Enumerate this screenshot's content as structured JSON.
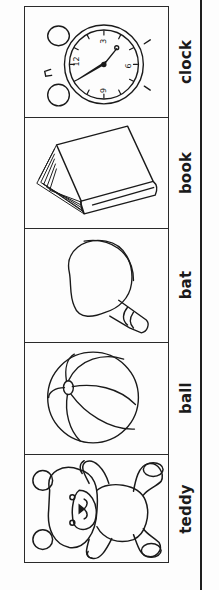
{
  "worksheet": {
    "items": [
      {
        "word": "clock",
        "picture": "alarm-clock"
      },
      {
        "word": "book",
        "picture": "book"
      },
      {
        "word": "bat",
        "picture": "table-tennis-bat"
      },
      {
        "word": "ball",
        "picture": "beach-ball"
      },
      {
        "word": "teddy",
        "picture": "teddy-bear"
      }
    ],
    "clock_face_numbers": [
      "12",
      "3",
      "6",
      "9"
    ]
  },
  "colors": {
    "background": "#ffffff",
    "ink": "#1a1a1a"
  }
}
